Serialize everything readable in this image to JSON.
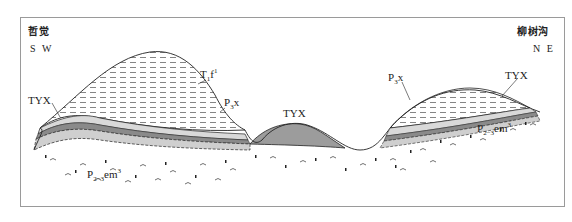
{
  "figure": {
    "type": "geological cross-section",
    "left_end": {
      "place": "哲觉",
      "direction": "S W"
    },
    "right_end": {
      "place": "柳树沟",
      "direction": "N E"
    }
  },
  "labels": {
    "t1f1": {
      "base": "T",
      "sub": "1",
      "mid": "f",
      "sup": "1"
    },
    "p3x_left": {
      "base": "P",
      "sub": "3",
      "mid": "x"
    },
    "p3x_right": {
      "base": "P",
      "sub": "3",
      "mid": "x"
    },
    "tyx_left": "TYX",
    "tyx_middle": "TYX",
    "tyx_right": "TYX",
    "p23em3_left": {
      "base": "P",
      "sub": "2−3",
      "mid": "em",
      "sup": "3"
    },
    "p23em3_right": {
      "base": "P",
      "sub": "2−3",
      "mid": "em",
      "sup": "3"
    }
  },
  "lithology_marks": {
    "al": "Al",
    "fe": "Fe"
  },
  "colors": {
    "frame": "#9a9a9a",
    "line": "#222222",
    "al_band": "#d9d9d9",
    "fe_band": "#cfcfcf",
    "dark_band": "#8a8a8a",
    "tyx_fill": "#9c9c9c"
  }
}
